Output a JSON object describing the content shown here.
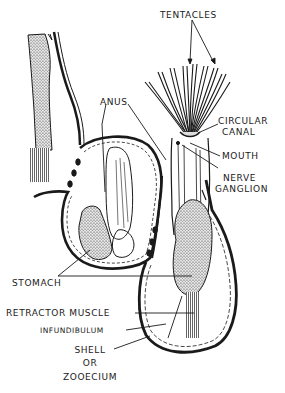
{
  "diagram": {
    "ink_color": "#1a1a1a",
    "background": "#ffffff",
    "labels": {
      "tentacles": "TENTACLES",
      "circular_canal_1": "CIRCULAR",
      "circular_canal_2": "CANAL",
      "mouth": "MOUTH",
      "nerve_ganglion_1": "NERVE",
      "nerve_ganglion_2": "GANGLION",
      "anus": "ANUS",
      "stomach": "STOMACH",
      "retractor_muscle": "RETRACTOR MUSCLE",
      "infundibulum": "INFUNDIBULUM",
      "shell_1": "SHELL",
      "shell_2": "OR",
      "shell_3": "ZOOECIUM"
    }
  }
}
